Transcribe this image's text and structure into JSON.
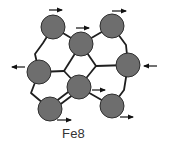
{
  "title": "Fe8",
  "colors": {
    "atom_fill": "#6e6e6e",
    "atom_stroke": "#2e2e2e",
    "bond": "#1e1e1e",
    "arrow": "#111111",
    "background": "#ffffff"
  },
  "atoms": [
    {
      "id": "A",
      "x": 53,
      "y": 27,
      "r": 12,
      "spin": "right"
    },
    {
      "id": "B",
      "x": 81,
      "y": 44,
      "r": 12,
      "spin": "right"
    },
    {
      "id": "C",
      "x": 112,
      "y": 26,
      "r": 12,
      "spin": "right"
    },
    {
      "id": "D",
      "x": 39,
      "y": 72,
      "r": 12,
      "spin": "left"
    },
    {
      "id": "E",
      "x": 128,
      "y": 65,
      "r": 12,
      "spin": "left"
    },
    {
      "id": "F",
      "x": 79,
      "y": 87,
      "r": 12,
      "spin": "right"
    },
    {
      "id": "G",
      "x": 50,
      "y": 109,
      "r": 12,
      "spin": "right"
    },
    {
      "id": "H",
      "x": 112,
      "y": 106,
      "r": 12,
      "spin": "right"
    }
  ],
  "bonds": [
    [
      [
        53,
        27
      ],
      [
        43,
        43
      ],
      [
        35,
        54
      ],
      [
        39,
        72
      ]
    ],
    [
      [
        53,
        27
      ],
      [
        81,
        44
      ]
    ],
    [
      [
        81,
        44
      ],
      [
        112,
        26
      ]
    ],
    [
      [
        112,
        26
      ],
      [
        126,
        45
      ],
      [
        128,
        65
      ]
    ],
    [
      [
        39,
        72
      ],
      [
        64,
        71
      ]
    ],
    [
      [
        81,
        44
      ],
      [
        64,
        71
      ]
    ],
    [
      [
        64,
        71
      ],
      [
        79,
        87
      ]
    ],
    [
      [
        81,
        44
      ],
      [
        96,
        66
      ]
    ],
    [
      [
        96,
        66
      ],
      [
        128,
        65
      ]
    ],
    [
      [
        96,
        66
      ],
      [
        79,
        87
      ]
    ],
    [
      [
        39,
        72
      ],
      [
        31,
        93
      ],
      [
        50,
        109
      ]
    ],
    [
      [
        79,
        87
      ],
      [
        112,
        106
      ]
    ],
    [
      [
        128,
        65
      ],
      [
        124,
        90
      ],
      [
        112,
        106
      ]
    ]
  ],
  "double_bond": [
    [
      50,
      109
    ],
    [
      79,
      87
    ]
  ],
  "arrows": [
    {
      "atom": "A",
      "x1": 49,
      "y1": 10,
      "x2": 62,
      "y2": 10,
      "direction": "right"
    },
    {
      "atom": "B",
      "x1": 76,
      "y1": 28,
      "x2": 89,
      "y2": 28,
      "direction": "right"
    },
    {
      "atom": "C",
      "x1": 112,
      "y1": 11,
      "x2": 126,
      "y2": 11,
      "direction": "right"
    },
    {
      "atom": "D",
      "x1": 25,
      "y1": 67,
      "x2": 12,
      "y2": 67,
      "direction": "left"
    },
    {
      "atom": "E",
      "x1": 157,
      "y1": 66,
      "x2": 144,
      "y2": 66,
      "direction": "left"
    },
    {
      "atom": "F",
      "x1": 92,
      "y1": 90,
      "x2": 105,
      "y2": 90,
      "direction": "right"
    },
    {
      "atom": "G",
      "x1": 57,
      "y1": 120,
      "x2": 71,
      "y2": 120,
      "direction": "right"
    },
    {
      "atom": "H",
      "x1": 120,
      "y1": 117,
      "x2": 133,
      "y2": 117,
      "direction": "right"
    }
  ]
}
